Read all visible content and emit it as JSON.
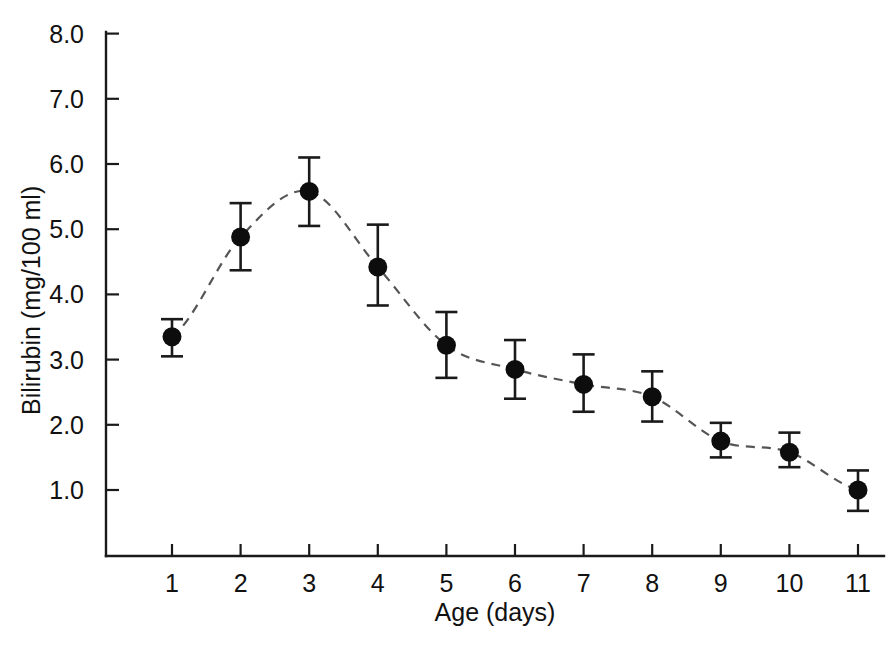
{
  "chart_data": {
    "type": "line",
    "title": "",
    "subtitle": "",
    "xlabel": "Age (days)",
    "ylabel": "Bilirubin (mg/100 ml)",
    "x": [
      1,
      2,
      3,
      4,
      5,
      6,
      7,
      8,
      9,
      10,
      11
    ],
    "values": [
      3.35,
      4.88,
      5.58,
      4.42,
      3.22,
      2.85,
      2.62,
      2.43,
      1.75,
      1.58,
      1.0
    ],
    "error_low": [
      3.05,
      4.37,
      5.05,
      3.83,
      2.72,
      2.4,
      2.2,
      2.05,
      1.5,
      1.35,
      0.68
    ],
    "error_high": [
      3.62,
      5.4,
      6.1,
      5.07,
      3.73,
      3.3,
      3.08,
      2.82,
      2.03,
      1.88,
      1.3
    ],
    "xlim": [
      0.55,
      11.45
    ],
    "ylim": [
      0.0,
      8.0
    ],
    "xticks": [
      1,
      2,
      3,
      4,
      5,
      6,
      7,
      8,
      9,
      10,
      11
    ],
    "xtick_labels": [
      "1",
      "2",
      "3",
      "4",
      "5",
      "6",
      "7",
      "8",
      "9",
      "10",
      "11"
    ],
    "yticks": [
      1.0,
      2.0,
      3.0,
      4.0,
      5.0,
      6.0,
      7.0,
      8.0
    ],
    "ytick_labels": [
      "1.0",
      "2.0",
      "3.0",
      "4.0",
      "5.0",
      "6.0",
      "7.0",
      "8.0"
    ],
    "grid": false,
    "legend": null,
    "line_style": "dashed",
    "marker_style": "filled-circle",
    "error_bars": "capped",
    "series": [
      {
        "name": "Bilirubin",
        "values": [
          3.35,
          4.88,
          5.58,
          4.42,
          3.22,
          2.85,
          2.62,
          2.43,
          1.75,
          1.58,
          1.0
        ]
      }
    ],
    "colors": {
      "line": "#555555",
      "marker": "#0d0d0d",
      "axis": "#1a1a1a",
      "error_bar": "#1a1a1a",
      "background": "#ffffff"
    }
  }
}
